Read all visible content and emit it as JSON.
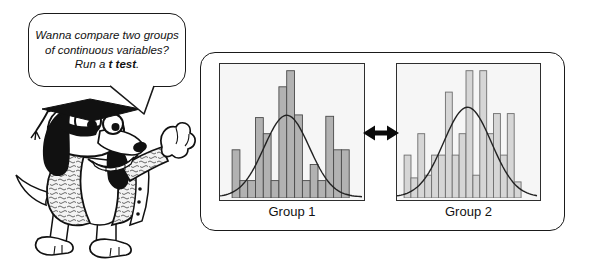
{
  "speech_bubble": {
    "line1": "Wanna compare two groups",
    "line2": "of continuous variables?",
    "run_prefix": "Run a ",
    "run_bold": "t test",
    "run_suffix": "."
  },
  "mascot": {
    "description_icons": [
      "graduation-cap-icon",
      "dog-face-icon"
    ]
  },
  "icons": {
    "double_arrow_glyph": "↔"
  },
  "chart_data": [
    {
      "type": "bar",
      "subtype": "histogram",
      "title": "Group 1",
      "ylabel": "",
      "xlabel": "",
      "ylim": [
        0,
        1
      ],
      "grid": false,
      "values": [
        0.36,
        0.13,
        0.13,
        0.6,
        0.48,
        0.13,
        0.83,
        0.95,
        0.62,
        0.13,
        0.25,
        0.13,
        0.61,
        0.36,
        0.36
      ],
      "overlay_curve": {
        "shape": "normal",
        "mean_frac": 0.47,
        "sigma_frac": 0.16,
        "peak_frac": 0.61
      },
      "bar_color": "#b2b2b2",
      "bar_border_color": "#4a4a4a",
      "bars_left_margin_frac": 0.085,
      "bars_right_margin_frac": 0.09
    },
    {
      "type": "bar",
      "subtype": "histogram",
      "title": "Group 2",
      "ylabel": "",
      "xlabel": "",
      "ylim": [
        0,
        1
      ],
      "grid": false,
      "values": [
        0.32,
        0.15,
        0.48,
        0.17,
        0.32,
        0.32,
        0.79,
        0.32,
        0.48,
        0.95,
        0.17,
        0.95,
        0.48,
        0.63,
        0.32,
        0.63,
        0.12
      ],
      "overlay_curve": {
        "shape": "normal",
        "mean_frac": 0.5,
        "sigma_frac": 0.17,
        "peak_frac": 0.67
      },
      "bar_color": "#d6d6d6",
      "bar_border_color": "#6e6e6e",
      "bars_left_margin_frac": 0.05,
      "bars_right_margin_frac": 0.12
    }
  ],
  "colors": {
    "background": "#ffffff",
    "outline": "#1a1a1a",
    "panel_bg": "#f6f6f6",
    "curve": "#222222",
    "arrow": "#0a0a0a"
  }
}
